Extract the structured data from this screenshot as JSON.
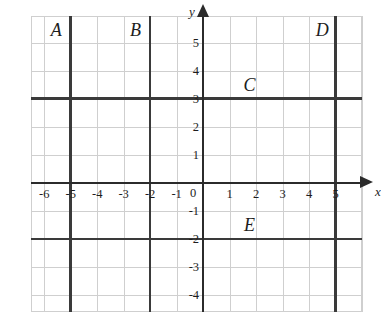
{
  "figure": {
    "background_color": "#ffffff",
    "grid_color": "#cfcfcf",
    "axis_color": "#2b2b2b",
    "bold_line_color": "#3a3a3a"
  },
  "axes": {
    "x_name": "x",
    "y_name": "y",
    "x_ticks": [
      "-6",
      "-5",
      "-4",
      "-3",
      "-2",
      "-1",
      "1",
      "2",
      "3",
      "4",
      "5"
    ],
    "x_tick_values": [
      -6,
      -5,
      -4,
      -3,
      -2,
      -1,
      1,
      2,
      3,
      4,
      5
    ],
    "y_ticks": [
      "5",
      "4",
      "3",
      "2",
      "1",
      "-1",
      "-2",
      "-3",
      "-4"
    ],
    "y_tick_values": [
      5,
      4,
      3,
      2,
      1,
      -1,
      -2,
      -3,
      -4
    ],
    "origin_label": "0",
    "x_range": [
      -6.5,
      6.0
    ],
    "y_range": [
      -4.6,
      5.95
    ]
  },
  "chart_data": {
    "type": "line",
    "title": "",
    "xlabel": "x",
    "ylabel": "y",
    "xlim": [
      -6.5,
      6.0
    ],
    "ylim": [
      -4.6,
      5.95
    ],
    "grid": true,
    "grid_spacing": 1,
    "lines": [
      {
        "label": "A",
        "orientation": "vertical",
        "equation": "x = -5",
        "value": -5,
        "label_x": -5.55,
        "label_y": 5.45
      },
      {
        "label": "B",
        "orientation": "vertical",
        "equation": "x = -2",
        "value": -2,
        "label_x": -2.55,
        "label_y": 5.45
      },
      {
        "label": "C",
        "orientation": "horizontal",
        "equation": "y = 3",
        "value": 3,
        "label_x": 1.75,
        "label_y": 3.5
      },
      {
        "label": "D",
        "orientation": "vertical",
        "equation": "x = 5",
        "value": 5,
        "label_x": 4.5,
        "label_y": 5.45
      },
      {
        "label": "E",
        "orientation": "horizontal",
        "equation": "y = -2",
        "value": -2,
        "label_x": 1.75,
        "label_y": -1.5
      }
    ]
  }
}
